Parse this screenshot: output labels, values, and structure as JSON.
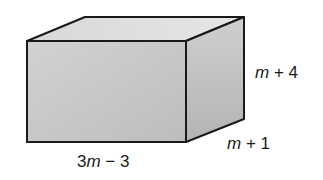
{
  "diagram": {
    "type": "rectangular prism",
    "labels": {
      "length": {
        "coef": "3",
        "var": "m",
        "rest": " − 3"
      },
      "height": {
        "var": "m",
        "rest": " + 4"
      },
      "depth": {
        "var": "m",
        "rest": " + 1"
      }
    },
    "colors": {
      "front": "#c8c8c8",
      "top": "#dedede",
      "side": "#bcbcbc",
      "edge": "#1a1a1a"
    }
  }
}
